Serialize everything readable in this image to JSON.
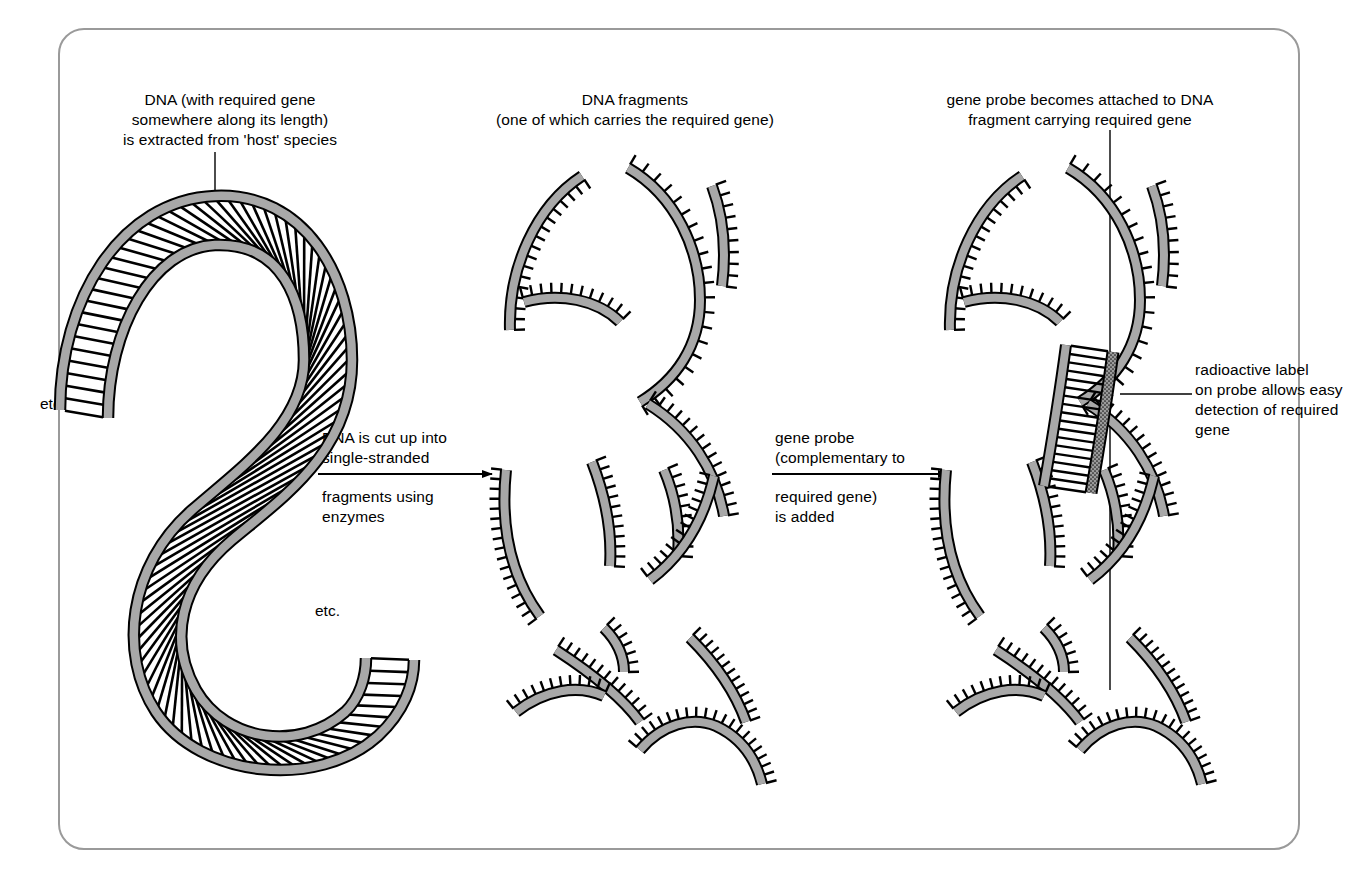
{
  "figure": {
    "title_absent": true,
    "background_color": "#ffffff",
    "frame_color": "#9a9a9a",
    "ink_color": "#000000",
    "backbone_fill": "#a8a8a8",
    "probe_fill": "#6e6e6e"
  },
  "panels": [
    {
      "id": "panel-dna",
      "caption": "DNA (with required gene\nsomewhere along its length)\nis extracted from 'host' species",
      "etc_labels": [
        "etc.",
        "etc."
      ]
    },
    {
      "id": "panel-fragments",
      "caption": "DNA fragments\n(one of which carries the required gene)"
    },
    {
      "id": "panel-probe",
      "caption": "gene probe becomes attached to DNA\nfragment carrying required gene",
      "side_label": "radioactive label\non probe allows easy\ndetection of required\ngene"
    }
  ],
  "arrows": [
    {
      "id": "arrow-1",
      "above": "DNA is cut up into\nsingle-stranded",
      "below": "fragments using\nenzymes"
    },
    {
      "id": "arrow-2",
      "above": "gene probe\n(complementary to",
      "below": "required gene)\nis added"
    }
  ]
}
